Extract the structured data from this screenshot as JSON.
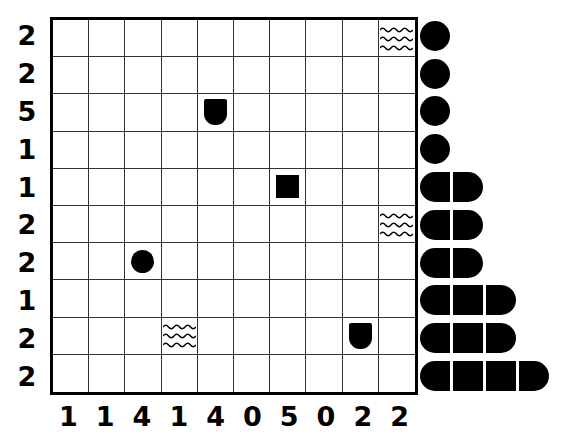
{
  "puzzle": {
    "grid": {
      "rows": 10,
      "cols": 10,
      "row_labels": [
        "2",
        "2",
        "5",
        "1",
        "1",
        "2",
        "2",
        "1",
        "2",
        "2"
      ],
      "col_labels": [
        "1",
        "1",
        "4",
        "1",
        "4",
        "0",
        "5",
        "0",
        "2",
        "2"
      ],
      "cells": [
        {
          "row": 0,
          "col": 9,
          "glyph": "waves-icon"
        },
        {
          "row": 2,
          "col": 4,
          "glyph": "u-shape-icon"
        },
        {
          "row": 4,
          "col": 6,
          "glyph": "square-icon"
        },
        {
          "row": 5,
          "col": 9,
          "glyph": "waves-icon"
        },
        {
          "row": 6,
          "col": 2,
          "glyph": "circle-icon"
        },
        {
          "row": 8,
          "col": 3,
          "glyph": "waves-icon"
        },
        {
          "row": 8,
          "col": 8,
          "glyph": "u-shape-icon"
        }
      ]
    },
    "bars": {
      "lengths": [
        1,
        1,
        1,
        1,
        2,
        2,
        2,
        3,
        3,
        4
      ]
    },
    "colors": {
      "ink": "#000000",
      "grid_line": "#333333",
      "background": "#ffffff"
    }
  }
}
